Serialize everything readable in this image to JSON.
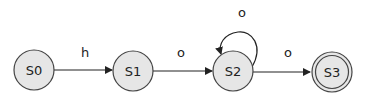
{
  "diagram": {
    "type": "finite-state-machine",
    "colors": {
      "node_fill": "#e6e6e6",
      "node_stroke": "#444444",
      "edge": "#222222",
      "background": "#ffffff"
    },
    "nodes": [
      {
        "id": "S0",
        "label": "S0",
        "accepting": false
      },
      {
        "id": "S1",
        "label": "S1",
        "accepting": false
      },
      {
        "id": "S2",
        "label": "S2",
        "accepting": false
      },
      {
        "id": "S3",
        "label": "S3",
        "accepting": true
      }
    ],
    "edges": [
      {
        "from": "S0",
        "to": "S1",
        "label": "h"
      },
      {
        "from": "S1",
        "to": "S2",
        "label": "o"
      },
      {
        "from": "S2",
        "to": "S2",
        "label": "o"
      },
      {
        "from": "S2",
        "to": "S3",
        "label": "o"
      }
    ]
  }
}
